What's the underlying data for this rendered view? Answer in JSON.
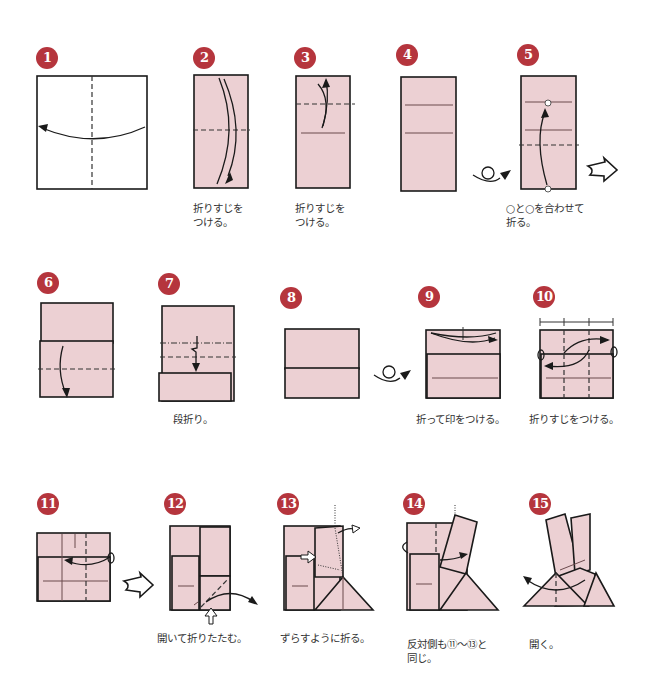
{
  "diagram": {
    "colors": {
      "badge": "#b5353d",
      "paper": "#ecd0d3",
      "line": "#1a1a1a"
    },
    "steps": [
      {
        "number": "1",
        "caption": ""
      },
      {
        "number": "2",
        "caption": "折りすじを\nつける。"
      },
      {
        "number": "3",
        "caption": "折りすじを\nつける。"
      },
      {
        "number": "4",
        "caption": ""
      },
      {
        "number": "5",
        "caption": "○と○を合わせて\n折る。"
      },
      {
        "number": "6",
        "caption": ""
      },
      {
        "number": "7",
        "caption": "段折り。"
      },
      {
        "number": "8",
        "caption": ""
      },
      {
        "number": "9",
        "caption": "折って印をつける。"
      },
      {
        "number": "10",
        "caption": "折りすじをつける。"
      },
      {
        "number": "11",
        "caption": ""
      },
      {
        "number": "12",
        "caption": "開いて折りたたむ。"
      },
      {
        "number": "13",
        "caption": "ずらすように折る。"
      },
      {
        "number": "14",
        "caption": "反対側も⑪〜⑬と\n同じ。"
      },
      {
        "number": "15",
        "caption": "開く。"
      }
    ],
    "icons": {
      "turn_over": "turn-over-icon",
      "next_arrow": "next-step-arrow-icon",
      "push_arrow": "push-arrow-icon"
    }
  }
}
